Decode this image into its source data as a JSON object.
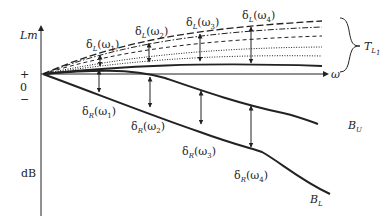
{
  "figure": {
    "type": "Bode magnitude bounds diagram",
    "y_axis": {
      "label": "Lm",
      "unit": "dB",
      "ticks": [
        "+",
        "0",
        "−"
      ]
    },
    "x_axis": {
      "label": "ω"
    },
    "brace_label": {
      "main": "T",
      "sub": "L",
      "subsub": "1"
    },
    "upper_deltas": [
      {
        "label": "δ",
        "sub": "L",
        "arg": "(ω",
        "argsub": "1",
        "close": ")"
      },
      {
        "label": "δ",
        "sub": "L",
        "arg": "(ω",
        "argsub": "2",
        "close": ")"
      },
      {
        "label": "δ",
        "sub": "L",
        "arg": "(ω",
        "argsub": "3",
        "close": ")"
      },
      {
        "label": "δ",
        "sub": "L",
        "arg": "(ω",
        "argsub": "4",
        "close": ")"
      }
    ],
    "lower_deltas": [
      {
        "label": "δ",
        "sub": "R",
        "arg": "(ω",
        "argsub": "1",
        "close": ")"
      },
      {
        "label": "δ",
        "sub": "R",
        "arg": "(ω",
        "argsub": "2",
        "close": ")"
      },
      {
        "label": "δ",
        "sub": "R",
        "arg": "(ω",
        "argsub": "3",
        "close": ")"
      },
      {
        "label": "δ",
        "sub": "R",
        "arg": "(ω",
        "argsub": "4",
        "close": ")"
      }
    ],
    "curve_labels": {
      "upper_bound": {
        "main": "B",
        "sub": "U"
      },
      "lower_bound": {
        "main": "B",
        "sub": "L"
      }
    },
    "colors": {
      "line": "#222222",
      "background": "#ffffff"
    }
  }
}
